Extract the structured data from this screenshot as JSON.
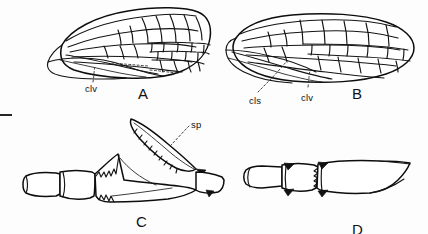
{
  "figure": {
    "kind": "scientific-line-drawing",
    "background_color": "#fdfdfd",
    "ink_color": "#111111",
    "width": 428,
    "height": 234
  },
  "panels": [
    {
      "id": "A",
      "label": "A",
      "label_x": 138,
      "label_y": 86,
      "content": "forewing with venation and claval region",
      "annotations": [
        {
          "name": "clv",
          "text": "clv",
          "x": 85,
          "y": 84,
          "leader_from_x": 93,
          "leader_from_y": 82,
          "leader_to_x": 95,
          "leader_to_y": 66
        }
      ]
    },
    {
      "id": "B",
      "label": "B",
      "label_x": 352,
      "label_y": 86,
      "content": "hindwing with venation, clavus and claval suture",
      "annotations": [
        {
          "name": "cls",
          "text": "cls",
          "x": 249,
          "y": 96,
          "leader_from_x": 258,
          "leader_from_y": 92,
          "leader_to_x": 286,
          "leader_to_y": 62
        },
        {
          "name": "clv",
          "text": "clv",
          "x": 301,
          "y": 93,
          "leader_from_x": 308,
          "leader_from_y": 87,
          "leader_to_x": 310,
          "leader_to_y": 70
        }
      ]
    },
    {
      "id": "C",
      "label": "C",
      "label_x": 136,
      "label_y": 214,
      "content": "tibia and tarsus bearing a large serrate spur",
      "annotations": [
        {
          "name": "sp",
          "text": "sp",
          "x": 191,
          "y": 120,
          "leader_from_x": 189,
          "leader_from_y": 126,
          "leader_to_x": 170,
          "leader_to_y": 146
        }
      ]
    },
    {
      "id": "D",
      "label": "D",
      "label_x": 352,
      "label_y": 222,
      "content": "tibia and tarsal segments with dark apical spines",
      "annotations": []
    }
  ],
  "scale_bar": {
    "present": true,
    "x": 0,
    "y": 114,
    "width": 12,
    "height": 2
  }
}
